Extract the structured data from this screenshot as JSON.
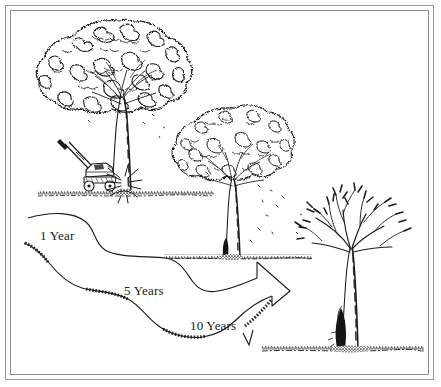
{
  "illustration": {
    "title": "Tree decline from lawn mower trunk injury",
    "style": "pen-and-ink line drawing, black on white",
    "border": {
      "style": "double-rule-frame",
      "color": "#9a9a9a"
    },
    "ink_color": "#1a1a1a",
    "background_color": "#ffffff"
  },
  "timeline": {
    "labels": [
      {
        "id": "year-1",
        "text": "1 Year",
        "x": 40,
        "y": 228
      },
      {
        "id": "year-5",
        "text": "5 Years",
        "x": 124,
        "y": 283
      },
      {
        "id": "year-10",
        "text": "10 Years",
        "x": 190,
        "y": 318
      }
    ],
    "arrow": {
      "description": "descending wavy ribbon arrow running left to right, ending in an arrowhead pointing down-right",
      "direction": "down-right",
      "shading": "hatched lower edge"
    }
  },
  "scene": {
    "trees": [
      {
        "id": "tree-healthy",
        "stage_label": "1 Year",
        "condition": "full dense canopy",
        "foliage": "full",
        "trunk_damage": "fresh impact at base",
        "position": {
          "x": 120,
          "y": 110
        }
      },
      {
        "id": "tree-declining",
        "stage_label": "5 Years",
        "condition": "thinning canopy",
        "foliage": "sparse",
        "trunk_damage": "dark wound at base",
        "position": {
          "x": 232,
          "y": 190
        }
      },
      {
        "id": "tree-dead",
        "stage_label": "10 Years",
        "condition": "dead, bare branches",
        "foliage": "none",
        "trunk_damage": "large dark decayed wound at base",
        "position": {
          "x": 350,
          "y": 270
        }
      }
    ],
    "mower": {
      "id": "lawn-mower",
      "description": "push lawn mower with angled handle striking the base of the healthy tree",
      "position": {
        "x": 88,
        "y": 172
      }
    },
    "impact": {
      "id": "impact-burst",
      "description": "radiating starburst lines where the mower strikes the trunk",
      "position": {
        "x": 122,
        "y": 182
      }
    },
    "ground_lines": [
      {
        "id": "ground-1",
        "y": 196,
        "x1": 38,
        "x2": 212
      },
      {
        "id": "ground-2",
        "y": 259,
        "x1": 165,
        "x2": 310
      },
      {
        "id": "ground-3",
        "y": 350,
        "x1": 262,
        "x2": 424
      }
    ]
  }
}
